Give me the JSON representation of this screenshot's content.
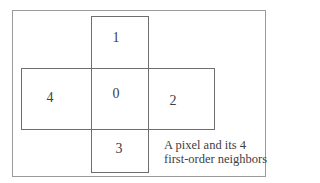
{
  "figure": {
    "type": "pixel-neighborhood-diagram",
    "cells": [
      {
        "id": "center",
        "label": "0"
      },
      {
        "id": "top",
        "label": "1"
      },
      {
        "id": "right",
        "label": "2"
      },
      {
        "id": "bottom",
        "label": "3"
      },
      {
        "id": "left",
        "label": "4"
      }
    ],
    "caption": {
      "line1": "A pixel and its 4",
      "line2": "first-order neighbors"
    }
  }
}
